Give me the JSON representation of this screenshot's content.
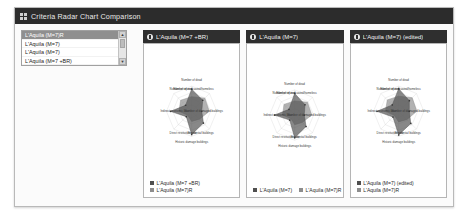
{
  "window": {
    "title": "Criteria Radar Chart Comparison",
    "menu_icon": "grid-icon"
  },
  "scenario_list": {
    "items": [
      {
        "label": "L'Aquila (M=7)R",
        "selected": true
      },
      {
        "label": "L'Aquila (M=7)",
        "selected": false
      },
      {
        "label": "L'Aquila (M=7)",
        "selected": false
      },
      {
        "label": "L'Aquila (M=7 +BR)",
        "selected": false
      }
    ],
    "scroll_up": "▲",
    "scroll_down": "▼"
  },
  "colors": {
    "series_primary": "#4f4f4f",
    "series_secondary": "#9b9b9b",
    "grid": "#c9c9c9",
    "header_bg": "#2f2f2f",
    "titlebar_bg": "#2c2c2c",
    "panel_border": "#b5b5b5"
  },
  "panels": [
    {
      "title": "L'Aquila (M=7 +BR)",
      "legend_layout": "vert",
      "legend": [
        {
          "label": "L'Aquila (M=7 +BR)",
          "color": "#4f4f4f"
        },
        {
          "label": "L'Aquila (M=7)R",
          "color": "#8d8d8d"
        }
      ],
      "chart_data": {
        "type": "radar",
        "title": "L'Aquila (M=7 +BR)",
        "categories": [
          "Number of dead",
          "Number of evacuated/homeless",
          "Number of damaged buildings",
          "Residential buildings",
          "Historic damage buildings",
          "Direct restitution cost",
          "Indirect economic loss",
          "Number of injured"
        ],
        "rlim": [
          0,
          1
        ],
        "grid": true,
        "legend_position": "bottom-left",
        "series": [
          {
            "name": "L'Aquila (M=7 +BR)",
            "color": "#4f4f4f",
            "values": [
              0.88,
              0.62,
              0.4,
              0.66,
              0.92,
              0.3,
              0.84,
              0.34
            ]
          },
          {
            "name": "L'Aquila (M=7)R",
            "color": "#8d8d8d",
            "values": [
              0.58,
              0.74,
              0.7,
              0.44,
              0.4,
              0.22,
              0.5,
              0.62
            ]
          }
        ]
      }
    },
    {
      "title": "L'Aquila (M=7)",
      "legend_layout": "horiz",
      "legend": [
        {
          "label": "L'Aquila (M=7)",
          "color": "#4f4f4f"
        },
        {
          "label": "L'Aquila (M=7)R",
          "color": "#8d8d8d"
        }
      ],
      "chart_data": {
        "type": "radar",
        "title": "L'Aquila (M=7)",
        "categories": [
          "Number of dead",
          "Number of evacuated/homeless",
          "Number of damaged buildings",
          "Residential buildings",
          "Historic damage buildings",
          "Direct restitution cost",
          "Indirect economic loss",
          "Number of injured"
        ],
        "rlim": [
          0,
          1
        ],
        "grid": true,
        "legend_position": "bottom",
        "series": [
          {
            "name": "L'Aquila (M=7)",
            "color": "#4f4f4f",
            "values": [
              0.86,
              0.58,
              0.38,
              0.64,
              0.9,
              0.28,
              0.8,
              0.32
            ]
          },
          {
            "name": "L'Aquila (M=7)R",
            "color": "#8d8d8d",
            "values": [
              0.56,
              0.72,
              0.68,
              0.42,
              0.38,
              0.2,
              0.48,
              0.6
            ]
          }
        ]
      }
    },
    {
      "title": "L'Aquila (M=7) (edited)",
      "legend_layout": "vert",
      "legend": [
        {
          "label": "L'Aquila (M=7) (edited)",
          "color": "#4f4f4f"
        },
        {
          "label": "L'Aquila (M=7)R",
          "color": "#8d8d8d"
        }
      ],
      "chart_data": {
        "type": "radar",
        "title": "L'Aquila (M=7) (edited)",
        "categories": [
          "Number of dead",
          "Number of evacuated/homeless",
          "Number of damaged buildings",
          "Residential buildings",
          "Historic damage buildings",
          "Direct restitution cost",
          "Indirect economic loss",
          "Number of injured"
        ],
        "rlim": [
          0,
          1
        ],
        "grid": true,
        "legend_position": "bottom-left",
        "series": [
          {
            "name": "L'Aquila (M=7) (edited)",
            "color": "#4f4f4f",
            "values": [
              0.9,
              0.6,
              0.42,
              0.68,
              0.94,
              0.32,
              0.86,
              0.36
            ]
          },
          {
            "name": "L'Aquila (M=7)R",
            "color": "#8d8d8d",
            "values": [
              0.6,
              0.76,
              0.72,
              0.46,
              0.42,
              0.24,
              0.52,
              0.64
            ]
          }
        ]
      }
    }
  ]
}
